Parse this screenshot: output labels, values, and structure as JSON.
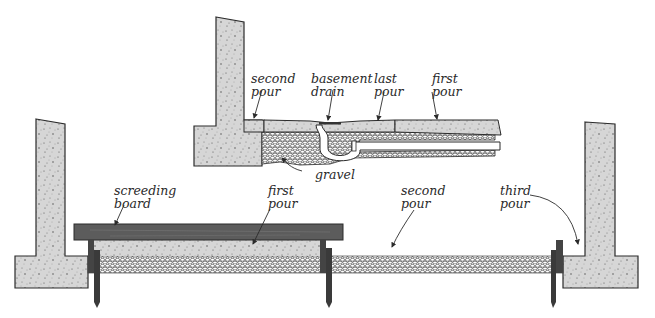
{
  "diagram": {
    "top_inset": {
      "labels": {
        "second_pour": "second\npour",
        "basement_drain": "basement\ndrain",
        "last_pour": "last\npour",
        "first_pour": "first\npour",
        "gravel": "gravel"
      }
    },
    "main_section": {
      "labels": {
        "screeding_board": "screeding\nboard",
        "first_pour": "first\npour",
        "second_pour": "second\npour",
        "third_pour": "third\npour"
      }
    },
    "colors": {
      "concrete": "#d6d6d6",
      "outline": "#2b2b2b",
      "board": "#5c5c5c",
      "gravel_bg": "#ffffff",
      "text": "#2a2a2a"
    }
  }
}
